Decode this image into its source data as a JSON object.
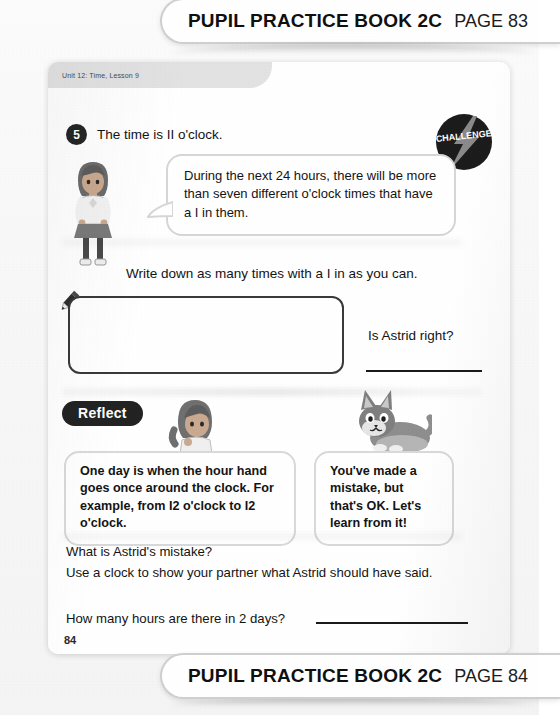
{
  "banners": {
    "top": {
      "title": "PUPIL PRACTICE BOOK 2C",
      "page": "PAGE 83"
    },
    "bottom": {
      "title": "PUPIL PRACTICE BOOK 2C",
      "page": "PAGE 84"
    }
  },
  "page": {
    "unit_strip": "Unit 12: Time, Lesson 9",
    "page_number": "84"
  },
  "question": {
    "number": "5",
    "stem": "The time is II o'clock.",
    "challenge_badge": "CHALLENGE",
    "bubble": "During the next 24 hours, there will be more than seven different o'clock times that have a I in them.",
    "instruction": "Write down as many times with a I in as you can.",
    "prompt": "Is Astrid right?",
    "answer_value": ""
  },
  "reflect": {
    "label": "Reflect",
    "bubble_left": "One day is when the hour hand goes once around the clock. For example, from I2 o'clock to I2 o'clock.",
    "bubble_right": "You've made a mistake, but that's OK. Let's learn from it!",
    "line_1": "What is Astrid's mistake?",
    "line_2": "Use a clock to show your partner what Astrid should have said.",
    "line_3": "How many hours are there in 2 days?"
  },
  "icons": {
    "pencil": "pencil-icon",
    "challenge": "lightning-bolt-icon",
    "astrid": "girl-character",
    "cat": "cat-character"
  },
  "colors": {
    "ink": "#141414",
    "badge_dark": "#232323",
    "paper": "#ffffff",
    "scan_bg": "#f7f7f7"
  }
}
